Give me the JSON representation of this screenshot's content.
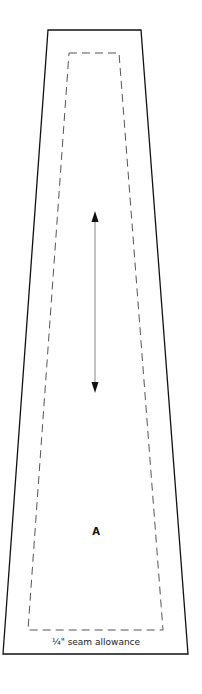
{
  "diagram": {
    "type": "sewing-pattern-piece",
    "piece_label": "A",
    "seam_allowance_label": "¼\" seam allowance",
    "grainline": "double-headed-arrow",
    "colors": {
      "cut_line": "#111111",
      "stitch_line": "#555555",
      "grainline": "#999999"
    }
  }
}
